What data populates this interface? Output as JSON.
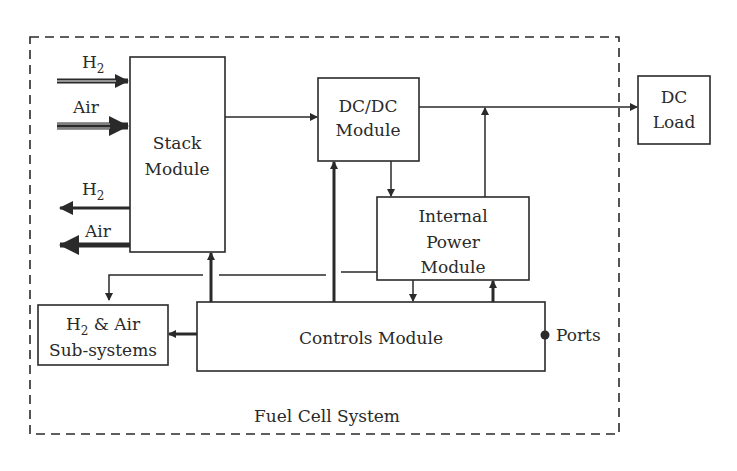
{
  "diagram": {
    "system_label": "Fuel Cell System",
    "blocks": {
      "stack": {
        "line1": "Stack",
        "line2": "Module"
      },
      "dcdc": {
        "line1": "DC/DC",
        "line2": "Module"
      },
      "dc_load": {
        "line1": "DC",
        "line2": "Load"
      },
      "internal_power": {
        "line1": "Internal",
        "line2": "Power",
        "line3": "Module"
      },
      "subsystems": {
        "line1_main": "H",
        "line1_sub": "2",
        "line1_tail": " & Air",
        "line2": "Sub-systems"
      },
      "controls": {
        "label": "Controls Module"
      }
    },
    "flows": {
      "h2_in": {
        "main": "H",
        "sub": "2"
      },
      "air_in": {
        "label": "Air"
      },
      "h2_out": {
        "main": "H",
        "sub": "2"
      },
      "air_out": {
        "label": "Air"
      }
    },
    "ports_label": "Ports",
    "colors": {
      "line": "#2a2a2a",
      "background": "#ffffff"
    }
  }
}
